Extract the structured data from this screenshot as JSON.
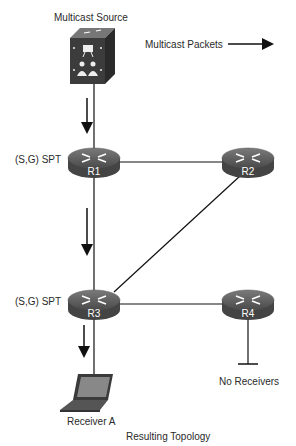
{
  "title": "Resulting Topology",
  "source": {
    "label": "Multicast Source"
  },
  "legend": {
    "label": "Multicast Packets"
  },
  "routers": [
    {
      "id": "R1",
      "label": "R1",
      "annotation": "(S,G) SPT"
    },
    {
      "id": "R2",
      "label": "R2"
    },
    {
      "id": "R3",
      "label": "R3",
      "annotation": "(S,G) SPT"
    },
    {
      "id": "R4",
      "label": "R4"
    }
  ],
  "receiver": {
    "label": "Receiver A"
  },
  "no_receivers": {
    "label": "No Receivers"
  },
  "links": [
    [
      "Multicast Source",
      "R1"
    ],
    [
      "R1",
      "R2"
    ],
    [
      "R1",
      "R3"
    ],
    [
      "R2",
      "R3"
    ],
    [
      "R3",
      "R4"
    ],
    [
      "R3",
      "Receiver A"
    ],
    [
      "R4",
      "No Receivers"
    ]
  ],
  "colors": {
    "device": "#3a3a3a",
    "device_top": "#6a6a6a",
    "line": "#111111"
  }
}
